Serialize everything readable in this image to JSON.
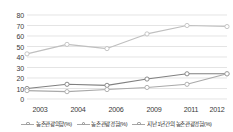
{
  "chart_data": {
    "type": "line",
    "title": "",
    "xlabel": "",
    "ylabel": "",
    "categories": [
      "2003",
      "2004",
      "2006",
      "2009",
      "2011",
      "2012"
    ],
    "ylim": [
      0,
      80
    ],
    "yticks": [
      0,
      10,
      20,
      30,
      40,
      50,
      60,
      70,
      80
    ],
    "grid": true,
    "legend_position": "bottom",
    "series": [
      {
        "name": "농촌관광의향(%)",
        "values": [
          43,
          52,
          48,
          62,
          70,
          69
        ],
        "color": "#bfbfbf",
        "marker": "circle-open"
      },
      {
        "name": "농촌관광경험(%)",
        "values": [
          10,
          14,
          13,
          19,
          24,
          24
        ],
        "color": "#808080",
        "marker": "circle-open"
      },
      {
        "name": "지난 1년간의 농촌관광경험(%)",
        "values": [
          8,
          7,
          9,
          11,
          14,
          24
        ],
        "color": "#a9a9a9",
        "marker": "circle-open"
      }
    ]
  },
  "axis": {
    "y_tick_labels": [
      "80",
      "70",
      "60",
      "50",
      "40",
      "30",
      "20",
      "10",
      "0"
    ],
    "x_tick_labels": [
      "2003",
      "2004",
      "2006",
      "2009",
      "2011",
      "2012"
    ]
  },
  "legend": {
    "items": [
      {
        "label": "농촌관광의향(%)"
      },
      {
        "label": "농촌관광경험(%)"
      },
      {
        "label": "지난 1년간의 농촌관광경험(%)"
      }
    ]
  },
  "colors": {
    "grid": "#d9d9d9",
    "axis_text": "#3a3a3a",
    "background": "#ffffff",
    "series_light": "#bfbfbf",
    "series_dark": "#808080",
    "series_mid": "#a9a9a9"
  }
}
